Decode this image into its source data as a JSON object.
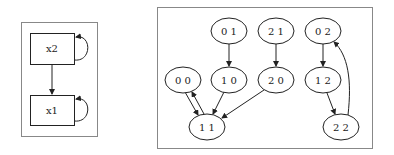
{
  "colors": {
    "stroke": "#222222",
    "frame": "#777777",
    "background": "#ffffff"
  },
  "left_graph": {
    "nodes": [
      {
        "id": "x2",
        "label": "x2",
        "shape": "box",
        "x": 30,
        "y": 33,
        "w": 44,
        "h": 31
      },
      {
        "id": "x1",
        "label": "x1",
        "shape": "box",
        "x": 30,
        "y": 95,
        "w": 44,
        "h": 30
      }
    ],
    "edges": [
      {
        "from": "x2",
        "to": "x1"
      },
      {
        "from": "x2",
        "to": "x2",
        "self_loop": true
      },
      {
        "from": "x1",
        "to": "x1",
        "self_loop": true
      }
    ]
  },
  "right_graph": {
    "nodes": [
      {
        "id": "01",
        "label": "0 1",
        "cx": 229,
        "cy": 31
      },
      {
        "id": "21",
        "label": "2 1",
        "cx": 276,
        "cy": 31
      },
      {
        "id": "02",
        "label": "0 2",
        "cx": 323,
        "cy": 31
      },
      {
        "id": "00",
        "label": "0 0",
        "cx": 183,
        "cy": 80
      },
      {
        "id": "10",
        "label": "1 0",
        "cx": 229,
        "cy": 80
      },
      {
        "id": "20",
        "label": "2 0",
        "cx": 276,
        "cy": 80
      },
      {
        "id": "12",
        "label": "1 2",
        "cx": 323,
        "cy": 80
      },
      {
        "id": "11",
        "label": "1 1",
        "cx": 207,
        "cy": 127
      },
      {
        "id": "22",
        "label": "2 2",
        "cx": 341,
        "cy": 127
      }
    ],
    "edges": [
      {
        "from": "01",
        "to": "10"
      },
      {
        "from": "21",
        "to": "20"
      },
      {
        "from": "02",
        "to": "12"
      },
      {
        "from": "00",
        "to": "11"
      },
      {
        "from": "11",
        "to": "00"
      },
      {
        "from": "10",
        "to": "11"
      },
      {
        "from": "20",
        "to": "11"
      },
      {
        "from": "12",
        "to": "22"
      },
      {
        "from": "22",
        "to": "02"
      }
    ]
  }
}
